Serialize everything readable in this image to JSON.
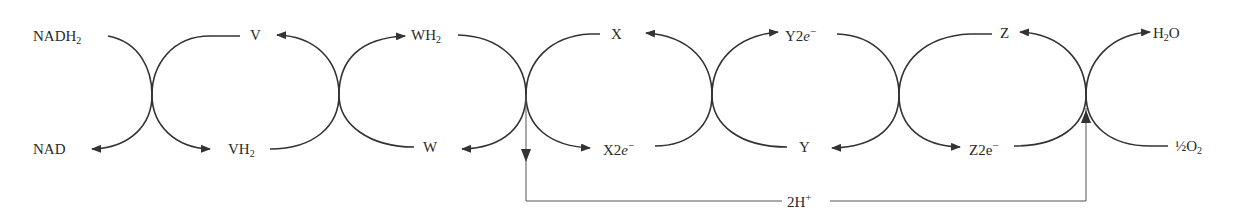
{
  "diagram": {
    "type": "redox-chain",
    "line_color": "#333333",
    "labels_top": [
      {
        "id": "nadh2",
        "base": "NADH",
        "sub": "2",
        "x": 33
      },
      {
        "id": "v",
        "base": "V",
        "x": 250
      },
      {
        "id": "wh2",
        "base": "WH",
        "sub": "2",
        "x": 411
      },
      {
        "id": "x",
        "base": "X",
        "x": 611
      },
      {
        "id": "y2e",
        "base": "Y2",
        "ital": "e",
        "sup": "−",
        "x": 785
      },
      {
        "id": "z",
        "base": "Z",
        "x": 1000
      },
      {
        "id": "h2o",
        "base": "H",
        "sub": "2",
        "tail": "O",
        "x": 1153
      }
    ],
    "labels_bottom": [
      {
        "id": "nad",
        "base": "NAD",
        "x": 33
      },
      {
        "id": "vh2",
        "base": "VH",
        "sub": "2",
        "x": 228
      },
      {
        "id": "w",
        "base": "W",
        "x": 423
      },
      {
        "id": "x2e",
        "base": "X2",
        "ital": "e",
        "sup": "−",
        "x": 603
      },
      {
        "id": "y",
        "base": "Y",
        "x": 799
      },
      {
        "id": "z2e",
        "base": "Z2e",
        "sup": "−",
        "x": 969
      },
      {
        "id": "half_o2",
        "base": "½O",
        "sub": "2",
        "x": 1175
      }
    ],
    "proton_label": {
      "base": "2H",
      "sup": "+"
    },
    "crossings_x": [
      152,
      339,
      526,
      712,
      899,
      1086
    ]
  }
}
